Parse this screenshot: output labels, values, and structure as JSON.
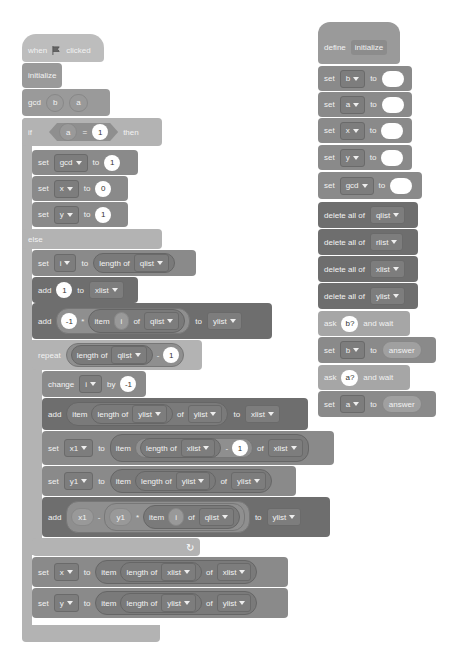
{
  "left_script": {
    "hat": {
      "when": "when",
      "flag_icon": "green-flag",
      "clicked": "clicked"
    },
    "initialize": "initialize",
    "gcd_call": {
      "label": "gcd",
      "arg1": "b",
      "arg2": "a"
    },
    "if_block": {
      "if": "if",
      "lhs": "a",
      "op": "=",
      "rhs": "1",
      "then": "then"
    },
    "then_branch": [
      {
        "set": "set",
        "var": "gcd",
        "to": "to",
        "value": "1"
      },
      {
        "set": "set",
        "var": "x",
        "to": "to",
        "value": "0"
      },
      {
        "set": "set",
        "var": "y",
        "to": "to",
        "value": "1"
      }
    ],
    "else": "else",
    "set_i": {
      "set": "set",
      "var": "i",
      "to": "to",
      "length_of": "length of",
      "list": "qlist"
    },
    "add_1": {
      "add": "add",
      "value": "1",
      "to": "to",
      "list": "xlist"
    },
    "add_neg": {
      "add": "add",
      "value": "-1",
      "op": "*",
      "item": "item",
      "index": "i",
      "of": "of",
      "list": "qlist",
      "to": "to",
      "target": "ylist"
    },
    "repeat": {
      "label": "repeat",
      "length_of": "length of",
      "list": "qlist",
      "op": "-",
      "value": "1"
    },
    "change_i": {
      "change": "change",
      "var": "i",
      "by": "by",
      "value": "-1"
    },
    "add_item": {
      "add": "add",
      "item": "item",
      "length_of": "length of",
      "list1": "ylist",
      "of": "of",
      "list2": "ylist",
      "to": "to",
      "target": "xlist"
    },
    "set_x1": {
      "set": "set",
      "var": "x1",
      "to": "to",
      "item": "item",
      "length_of": "length of",
      "list1": "xlist",
      "op": "-",
      "value": "1",
      "of": "of",
      "list2": "xlist"
    },
    "set_y1": {
      "set": "set",
      "var": "y1",
      "to": "to",
      "item": "item",
      "length_of": "length of",
      "list1": "ylist",
      "of": "of",
      "list2": "ylist"
    },
    "add_calc": {
      "add": "add",
      "v1": "x1",
      "minus": "-",
      "v2": "y1",
      "times": "*",
      "item": "item",
      "index": "i",
      "of": "of",
      "list": "qlist",
      "to": "to",
      "target": "ylist"
    },
    "loop_arrow": "↻",
    "set_x": {
      "set": "set",
      "var": "x",
      "to": "to",
      "item": "item",
      "length_of": "length of",
      "list1": "xlist",
      "of": "of",
      "list2": "xlist"
    },
    "set_y": {
      "set": "set",
      "var": "y",
      "to": "to",
      "item": "item",
      "length_of": "length of",
      "list1": "ylist",
      "of": "of",
      "list2": "ylist"
    }
  },
  "right_script": {
    "define": {
      "label": "define",
      "name": "initialize"
    },
    "sets": [
      {
        "set": "set",
        "var": "b",
        "to": "to"
      },
      {
        "set": "set",
        "var": "a",
        "to": "to"
      },
      {
        "set": "set",
        "var": "x",
        "to": "to"
      },
      {
        "set": "set",
        "var": "y",
        "to": "to"
      },
      {
        "set": "set",
        "var": "gcd",
        "to": "to"
      }
    ],
    "deletes": [
      {
        "label": "delete all of",
        "list": "qlist"
      },
      {
        "label": "delete all of",
        "list": "rlist"
      },
      {
        "label": "delete all of",
        "list": "xlist"
      },
      {
        "label": "delete all of",
        "list": "ylist"
      }
    ],
    "ask_b": {
      "ask": "ask",
      "q": "b?",
      "wait": "and wait"
    },
    "set_b": {
      "set": "set",
      "var": "b",
      "to": "to",
      "answer": "answer"
    },
    "ask_a": {
      "ask": "ask",
      "q": "a?",
      "wait": "and wait"
    },
    "set_a": {
      "set": "set",
      "var": "a",
      "to": "to",
      "answer": "answer"
    }
  }
}
